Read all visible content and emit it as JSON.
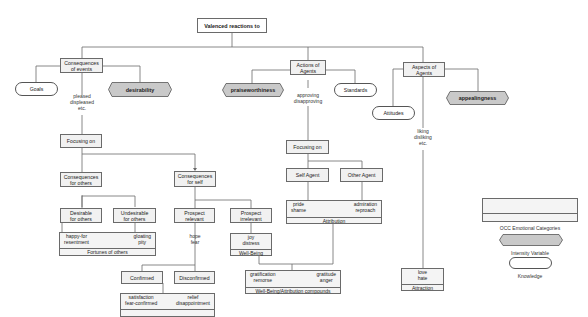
{
  "diagram": {
    "title": "Valenced reactions to",
    "branches": {
      "events": {
        "label_line1": "Consequences",
        "label_line2": "of events",
        "knowledge": "Goals",
        "intensity": "desirability",
        "reaction_words": [
          "pleased",
          "displeased",
          "etc."
        ],
        "focus": "Focusing on",
        "others": {
          "label_line1": "Consequences",
          "label_line2": "for others",
          "desirable_line1": "Desirable",
          "desirable_line2": "for others",
          "undesirable_line1": "Undesirable",
          "undesirable_line2": "for others",
          "category": {
            "left": [
              "happy-for",
              "resentment"
            ],
            "right": [
              "gloating",
              "pity"
            ],
            "name": "Fortunes of others"
          }
        },
        "self": {
          "label_line1": "Consequences",
          "label_line2": "for self",
          "prospect_relevant_line1": "Prospect",
          "prospect_relevant_line2": "relevant",
          "prospect_irrelevant_line1": "Prospect",
          "prospect_irrelevant_line2": "irrelevant",
          "hope_fear": [
            "hope",
            "fear"
          ],
          "wellbeing": {
            "words": [
              "joy",
              "distress"
            ],
            "name": "Well-Being"
          },
          "confirmed": "Confirmed",
          "disconfirmed": "Disconfirmed",
          "prospect_based": {
            "left": [
              "satisfaction",
              "fear-confirmed"
            ],
            "right": [
              "relief",
              "disappointment"
            ],
            "name": ""
          }
        }
      },
      "agents": {
        "label_line1": "Actions of",
        "label_line2": "Agents",
        "knowledge": "Standards",
        "intensity": "praiseworthiness",
        "reaction_words": [
          "approving",
          "disapproving"
        ],
        "focus": "Focusing on",
        "self_agent": "Self Agent",
        "other_agent": "Other Agent",
        "attribution": {
          "left": [
            "pride",
            "shame"
          ],
          "right": [
            "admiration",
            "reproach"
          ],
          "name": "Attribution"
        },
        "compounds": {
          "left": [
            "gratification",
            "remorse"
          ],
          "right": [
            "gratitude",
            "anger"
          ],
          "name": "Well-Being/Attribution compounds"
        }
      },
      "aspects": {
        "label_line1": "Aspects of",
        "label_line2": "Agents",
        "knowledge": "Attitudes",
        "intensity": "appealingness",
        "reaction_words": [
          "liking",
          "disliking",
          "etc."
        ],
        "attraction": {
          "words": [
            "love",
            "hate"
          ],
          "name": "Attraction"
        }
      }
    },
    "legend": {
      "category": "OCC Emotional Categories",
      "intensity": "Intensity Variable",
      "knowledge": "Knowledge"
    },
    "colors": {
      "line": "#6a6a6a",
      "box_fill": "#f1f1f1",
      "hex_fill": "#c9c9c9"
    }
  }
}
